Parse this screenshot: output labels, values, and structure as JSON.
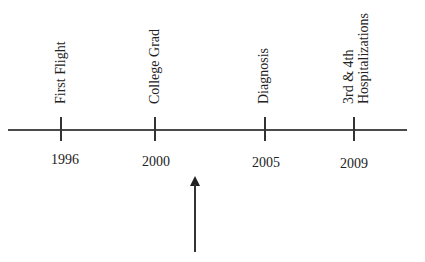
{
  "timeline": {
    "events": [
      {
        "label": "First Flight",
        "year": "1996"
      },
      {
        "label": "College Grad",
        "year": "2000"
      },
      {
        "label": "Diagnosis",
        "year": "2005"
      },
      {
        "label_line1": "3rd & 4th",
        "label_line2": "Hospitalizations",
        "year": "2009"
      }
    ],
    "pointer": "arrow-up-icon"
  }
}
